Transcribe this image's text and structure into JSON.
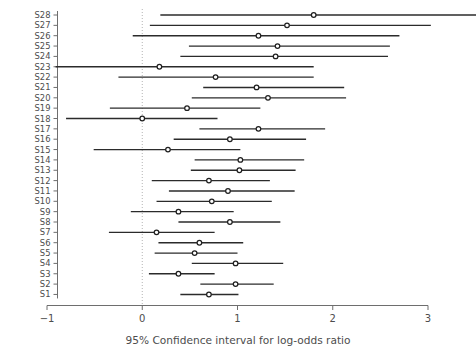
{
  "chart_data": {
    "type": "scatter",
    "subtype": "forest-plot",
    "title": "",
    "xlabel": "95% Confidence interval for log-odds ratio",
    "ylabel": "",
    "xlim": [
      -1,
      3
    ],
    "ylim_categories": [
      "S1",
      "S28"
    ],
    "xticks": [
      -1,
      0,
      1,
      2,
      3
    ],
    "xtick_labels": [
      "−1",
      "0",
      "1",
      "2",
      "3"
    ],
    "grid": false,
    "legend": null,
    "reference_line": {
      "x": 0,
      "style": "dotted",
      "color": "#b4b4b4"
    },
    "categories": [
      "S28",
      "S27",
      "S26",
      "S25",
      "S24",
      "S23",
      "S22",
      "S21",
      "S20",
      "S19",
      "S18",
      "S17",
      "S16",
      "S15",
      "S14",
      "S13",
      "S12",
      "S11",
      "S10",
      "S9",
      "S8",
      "S7",
      "S6",
      "S5",
      "S4",
      "S3",
      "S2",
      "S1"
    ],
    "series": [
      {
        "name": "estimate",
        "values": [
          1.8,
          1.52,
          1.22,
          1.42,
          1.4,
          0.18,
          0.77,
          1.2,
          1.32,
          0.47,
          0.0,
          1.22,
          0.92,
          0.27,
          1.03,
          1.02,
          0.7,
          0.9,
          0.73,
          0.38,
          0.92,
          0.15,
          0.6,
          0.55,
          0.98,
          0.38,
          0.98,
          0.7
        ]
      },
      {
        "name": "ci_low",
        "values": [
          0.19,
          0.08,
          -0.1,
          0.49,
          0.4,
          -0.91,
          -0.25,
          0.64,
          0.52,
          -0.34,
          -0.8,
          0.6,
          0.33,
          -0.51,
          0.55,
          0.51,
          0.1,
          0.28,
          0.15,
          -0.12,
          0.38,
          -0.35,
          0.17,
          0.13,
          0.52,
          0.07,
          0.61,
          0.4
        ]
      },
      {
        "name": "ci_high",
        "values": [
          3.55,
          3.03,
          2.7,
          2.6,
          2.58,
          1.8,
          1.8,
          2.12,
          2.14,
          1.24,
          0.79,
          1.92,
          1.72,
          1.03,
          1.7,
          1.61,
          1.34,
          1.6,
          1.36,
          0.96,
          1.45,
          0.76,
          1.06,
          1.0,
          1.48,
          0.76,
          1.38,
          1.01
        ]
      }
    ],
    "points": [
      {
        "label": "S28",
        "estimate": 1.8,
        "ci_low": 0.19,
        "ci_high": 3.55
      },
      {
        "label": "S27",
        "estimate": 1.52,
        "ci_low": 0.08,
        "ci_high": 3.03
      },
      {
        "label": "S26",
        "estimate": 1.22,
        "ci_low": -0.1,
        "ci_high": 2.7
      },
      {
        "label": "S25",
        "estimate": 1.42,
        "ci_low": 0.49,
        "ci_high": 2.6
      },
      {
        "label": "S24",
        "estimate": 1.4,
        "ci_low": 0.4,
        "ci_high": 2.58
      },
      {
        "label": "S23",
        "estimate": 0.18,
        "ci_low": -0.91,
        "ci_high": 1.8
      },
      {
        "label": "S22",
        "estimate": 0.77,
        "ci_low": -0.25,
        "ci_high": 1.8
      },
      {
        "label": "S21",
        "estimate": 1.2,
        "ci_low": 0.64,
        "ci_high": 2.12
      },
      {
        "label": "S20",
        "estimate": 1.32,
        "ci_low": 0.52,
        "ci_high": 2.14
      },
      {
        "label": "S19",
        "estimate": 0.47,
        "ci_low": -0.34,
        "ci_high": 1.24
      },
      {
        "label": "S18",
        "estimate": 0.0,
        "ci_low": -0.8,
        "ci_high": 0.79
      },
      {
        "label": "S17",
        "estimate": 1.22,
        "ci_low": 0.6,
        "ci_high": 1.92
      },
      {
        "label": "S16",
        "estimate": 0.92,
        "ci_low": 0.33,
        "ci_high": 1.72
      },
      {
        "label": "S15",
        "estimate": 0.27,
        "ci_low": -0.51,
        "ci_high": 1.03
      },
      {
        "label": "S14",
        "estimate": 1.03,
        "ci_low": 0.55,
        "ci_high": 1.7
      },
      {
        "label": "S13",
        "estimate": 1.02,
        "ci_low": 0.51,
        "ci_high": 1.61
      },
      {
        "label": "S12",
        "estimate": 0.7,
        "ci_low": 0.1,
        "ci_high": 1.34
      },
      {
        "label": "S11",
        "estimate": 0.9,
        "ci_low": 0.28,
        "ci_high": 1.6
      },
      {
        "label": "S10",
        "estimate": 0.73,
        "ci_low": 0.15,
        "ci_high": 1.36
      },
      {
        "label": "S9",
        "estimate": 0.38,
        "ci_low": -0.12,
        "ci_high": 0.96
      },
      {
        "label": "S8",
        "estimate": 0.92,
        "ci_low": 0.38,
        "ci_high": 1.45
      },
      {
        "label": "S7",
        "estimate": 0.15,
        "ci_low": -0.35,
        "ci_high": 0.76
      },
      {
        "label": "S6",
        "estimate": 0.6,
        "ci_low": 0.17,
        "ci_high": 1.06
      },
      {
        "label": "S5",
        "estimate": 0.55,
        "ci_low": 0.13,
        "ci_high": 1.0
      },
      {
        "label": "S4",
        "estimate": 0.98,
        "ci_low": 0.52,
        "ci_high": 1.48
      },
      {
        "label": "S3",
        "estimate": 0.38,
        "ci_low": 0.07,
        "ci_high": 0.76
      },
      {
        "label": "S2",
        "estimate": 0.98,
        "ci_low": 0.61,
        "ci_high": 1.38
      },
      {
        "label": "S1",
        "estimate": 0.7,
        "ci_low": 0.4,
        "ci_high": 1.01
      }
    ]
  },
  "axis": {
    "x_title": "95% Confidence interval for log-odds ratio",
    "tick_labels": [
      "−1",
      "0",
      "1",
      "2",
      "3"
    ]
  },
  "colors": {
    "line": "#2b2b2b",
    "point_stroke": "#1f1f1f",
    "point_fill": "#ffffff",
    "axis": "#6e6e6e",
    "reference": "#b4b4b4",
    "text": "#4d4d4d",
    "background": "#ffffff"
  }
}
